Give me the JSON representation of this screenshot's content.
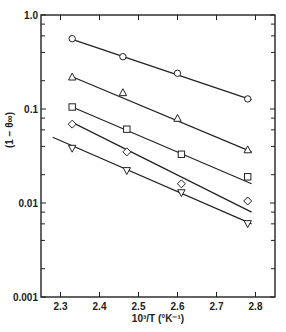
{
  "chart_data": {
    "type": "scatter",
    "title": "",
    "xlabel": "10³/T (°K⁻¹)",
    "ylabel": "(1 − θ∞)",
    "yscale": "log",
    "xlim": [
      2.25,
      2.85
    ],
    "ylim": [
      0.001,
      1.0
    ],
    "grid": false,
    "legend": null,
    "x_ticks": [
      2.3,
      2.4,
      2.5,
      2.6,
      2.7,
      2.8
    ],
    "x_tick_labels": [
      "2.3",
      "2.4",
      "2.5",
      "2.6",
      "2.7",
      "2.8"
    ],
    "y_ticks": [
      1.0,
      0.1,
      0.01,
      0.001
    ],
    "y_tick_labels": [
      "1.0",
      "0.1",
      "0.01",
      "0.001"
    ],
    "series": [
      {
        "name": "circle",
        "marker": "circle",
        "x": [
          2.33,
          2.46,
          2.6,
          2.78
        ],
        "y": [
          0.56,
          0.36,
          0.24,
          0.128
        ],
        "fit_line": {
          "x": [
            2.33,
            2.79
          ],
          "y": [
            0.55,
            0.125
          ]
        }
      },
      {
        "name": "triangle",
        "marker": "triangle-up",
        "x": [
          2.33,
          2.46,
          2.6,
          2.78
        ],
        "y": [
          0.22,
          0.15,
          0.08,
          0.037
        ],
        "fit_line": {
          "x": [
            2.33,
            2.79
          ],
          "y": [
            0.22,
            0.035
          ]
        }
      },
      {
        "name": "square",
        "marker": "square",
        "x": [
          2.33,
          2.47,
          2.61,
          2.78
        ],
        "y": [
          0.105,
          0.061,
          0.033,
          0.019
        ],
        "fit_line": {
          "x": [
            2.33,
            2.79
          ],
          "y": [
            0.105,
            0.016
          ]
        }
      },
      {
        "name": "diamond",
        "marker": "diamond",
        "x": [
          2.33,
          2.47,
          2.61,
          2.78
        ],
        "y": [
          0.069,
          0.035,
          0.016,
          0.0105
        ],
        "fit_line": {
          "x": [
            2.33,
            2.79
          ],
          "y": [
            0.072,
            0.008
          ]
        }
      },
      {
        "name": "inverted-triangle",
        "marker": "triangle-down",
        "x": [
          2.33,
          2.47,
          2.61,
          2.78
        ],
        "y": [
          0.038,
          0.022,
          0.0128,
          0.006
        ],
        "fit_line": {
          "x": [
            2.28,
            2.79
          ],
          "y": [
            0.05,
            0.006
          ]
        }
      }
    ]
  }
}
